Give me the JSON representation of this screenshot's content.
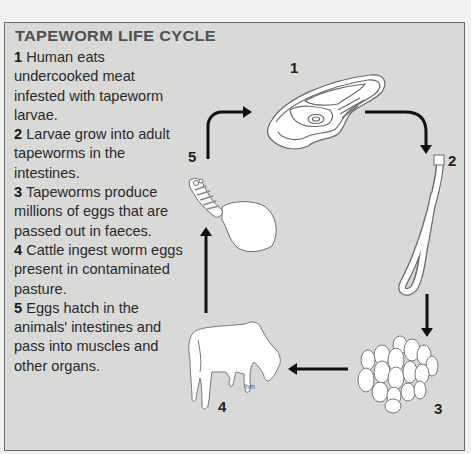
{
  "title": "TAPEWORM LIFE CYCLE",
  "steps": [
    {
      "num": "1",
      "text": "Human eats undercooked meat infested with tapeworm larvae."
    },
    {
      "num": "2",
      "text": "Larvae grow into adult tapeworms in the intestines."
    },
    {
      "num": "3",
      "text": "Tapeworms produce millions of eggs that are passed out in faeces."
    },
    {
      "num": "4",
      "text": "Cattle ingest worm eggs present in contaminated pasture."
    },
    {
      "num": "5",
      "text": "Eggs hatch in the animals' intestines and pass into muscles and other organs."
    }
  ],
  "diagram": {
    "labels": {
      "s1": "1",
      "s2": "2",
      "s3": "3",
      "s4": "4",
      "s5": "5"
    },
    "stages": [
      {
        "id": "s1",
        "icon": "meat-steak-icon"
      },
      {
        "id": "s2",
        "icon": "tapeworm-icon"
      },
      {
        "id": "s3",
        "icon": "egg-cluster-icon"
      },
      {
        "id": "s4",
        "icon": "cow-icon"
      },
      {
        "id": "s5",
        "icon": "larva-cyst-icon"
      }
    ],
    "signature": "hm",
    "colors": {
      "panel": "#d9d9d8",
      "border": "#6e6e6e",
      "arrow": "#111111",
      "drawing_fill": "#ffffff",
      "drawing_stroke": "#6a6a6a"
    }
  }
}
